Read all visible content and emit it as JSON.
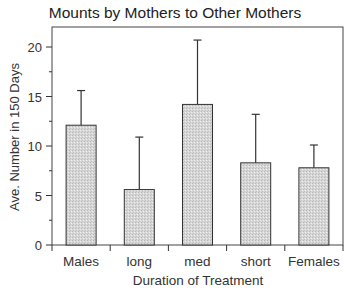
{
  "chart_data": {
    "type": "bar",
    "title": "Mounts by Mothers to Other Mothers",
    "xlabel": "Duration of Treatment",
    "ylabel": "Ave. Number in 150 Days",
    "categories": [
      "Males",
      "long",
      "med",
      "short",
      "Females"
    ],
    "values": [
      12.1,
      5.6,
      14.2,
      8.3,
      7.8
    ],
    "error_upper": [
      15.6,
      10.9,
      20.7,
      13.2,
      10.1
    ],
    "ylim": [
      0,
      22
    ],
    "yticks": [
      0,
      5,
      10,
      15,
      20
    ],
    "minor_yticks": [
      2.5,
      7.5,
      12.5,
      17.5
    ],
    "grid": false,
    "legend": null,
    "bar_fill": "#d6d6d6",
    "bar_stroke": "#333333"
  }
}
